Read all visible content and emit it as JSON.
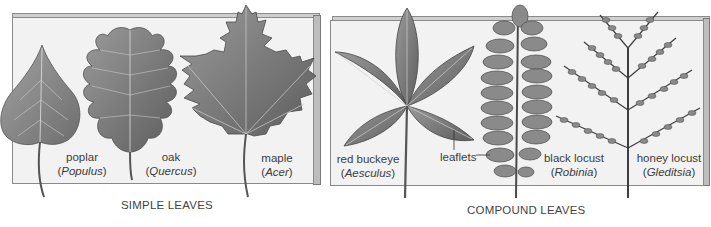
{
  "figure": {
    "panels": [
      {
        "id": "simple",
        "caption": "SIMPLE LEAVES",
        "leaves": [
          {
            "common": "poplar",
            "genus": "Populus"
          },
          {
            "common": "oak",
            "genus": "Quercus"
          },
          {
            "common": "maple",
            "genus": "Acer"
          }
        ]
      },
      {
        "id": "compound",
        "caption": "COMPOUND LEAVES",
        "leaves": [
          {
            "common": "red buckeye",
            "genus": "Aesculus"
          },
          {
            "common": "black locust",
            "genus": "Robinia"
          },
          {
            "common": "honey locust",
            "genus": "Gleditsia"
          }
        ],
        "callout": "leaflets"
      }
    ],
    "colors": {
      "panel_face": "#f2f2f2",
      "panel_edge": "#bdbdbd",
      "leaf_fill": "#8c8c8c",
      "leaf_dark": "#5a5a5a",
      "text": "#3c3c3c"
    }
  }
}
